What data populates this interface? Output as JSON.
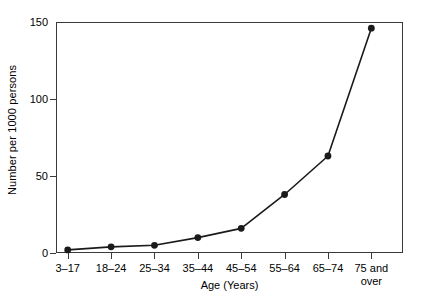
{
  "chart_data": {
    "type": "line",
    "title": "",
    "xlabel": "Age (Years)",
    "ylabel": "Number per 1000 persons",
    "categories": [
      "3–17",
      "18–24",
      "25–34",
      "35–44",
      "45–54",
      "55–64",
      "65–74",
      "75 and over"
    ],
    "category_lines": [
      [
        "3–17"
      ],
      [
        "18–24"
      ],
      [
        "25–34"
      ],
      [
        "35–44"
      ],
      [
        "45–54"
      ],
      [
        "55–64"
      ],
      [
        "65–74"
      ],
      [
        "75 and",
        "over"
      ]
    ],
    "values": [
      2,
      4,
      5,
      10,
      16,
      38,
      63,
      146
    ],
    "ylim": [
      0,
      150
    ],
    "yticks": [
      0,
      50,
      100,
      150
    ],
    "ytick_labels": [
      "0",
      "50",
      "100",
      "150"
    ],
    "grid": false,
    "legend": false,
    "marker": "filled-circle",
    "series_color": "#1a1a1a",
    "axis_color": "#3a3a3a",
    "background_color": "#ffffff"
  }
}
